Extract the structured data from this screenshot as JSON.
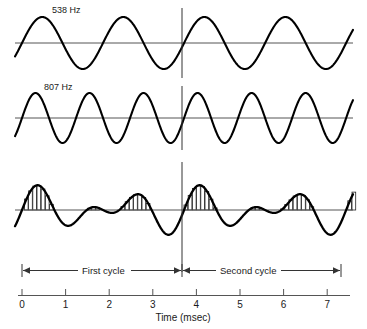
{
  "figure": {
    "title": "",
    "waves": [
      {
        "name": "wave-538",
        "label": "538 Hz",
        "frequency_hz": 538,
        "label_x": 52,
        "label_y": 13,
        "baseline_y": 43,
        "amplitude": 26,
        "phase_deg": 0
      },
      {
        "name": "wave-807",
        "label": "807 Hz",
        "frequency_hz": 807,
        "label_x": 44,
        "label_y": 90,
        "baseline_y": 118,
        "amplitude": 25,
        "phase_deg": 0
      }
    ],
    "composite": {
      "name": "composite-wave",
      "baseline_y": 210,
      "amplitude": 26,
      "histogram_note": "spike-histogram-bars"
    },
    "divider_line": {
      "x": 182,
      "time_ms": 3.64
    },
    "brackets": [
      {
        "label": "First cycle",
        "x1": 22,
        "x2": 182,
        "y": 270
      },
      {
        "label": "Second cycle",
        "x1": 182,
        "x2": 341,
        "y": 270
      }
    ],
    "axis": {
      "title": "Time (msec)",
      "x_origin_px": 22,
      "px_per_ms": 43.6,
      "y": 295,
      "ticks": [
        "0",
        "1",
        "2",
        "3",
        "4",
        "5",
        "6",
        "7"
      ],
      "tick_values": [
        0,
        1,
        2,
        3,
        4,
        5,
        6,
        7
      ]
    },
    "colors": {
      "wave": "#000000",
      "baseline": "#555555",
      "axis": "#555555",
      "bars": "#222222",
      "bar_fill": "#ffffff",
      "text": "#1a1a1a"
    }
  },
  "chart_data": {
    "type": "line",
    "title": "",
    "subtitle": "",
    "xlabel": "Time (msec)",
    "ylabel": "",
    "xlim": [
      0,
      7.3
    ],
    "grid": false,
    "legend_position": "inline-left",
    "annotations": [
      "538 Hz",
      "807 Hz",
      "First cycle",
      "Second cycle"
    ],
    "series": [
      {
        "name": "538 Hz",
        "type": "sine",
        "frequency_hz": 538,
        "amplitude": 1.0,
        "phase_deg": 0
      },
      {
        "name": "807 Hz",
        "type": "sine",
        "frequency_hz": 807,
        "amplitude": 1.0,
        "phase_deg": 0
      },
      {
        "name": "Sum (538 + 807 Hz)",
        "type": "sum",
        "components": [
          538,
          807
        ],
        "amplitude": 1.0
      }
    ],
    "histogram": {
      "name": "spike-histogram",
      "description": "Bars drawn under the positive half-cycles of the summed waveform",
      "bin_width_ms": 0.1
    },
    "xticks": [
      0,
      1,
      2,
      3,
      4,
      5,
      6,
      7
    ],
    "xticklabels": [
      "0",
      "1",
      "2",
      "3",
      "4",
      "5",
      "6",
      "7"
    ],
    "period_markers": {
      "beat_period_ms": 3.64,
      "cycles": [
        "First cycle",
        "Second cycle"
      ]
    }
  }
}
